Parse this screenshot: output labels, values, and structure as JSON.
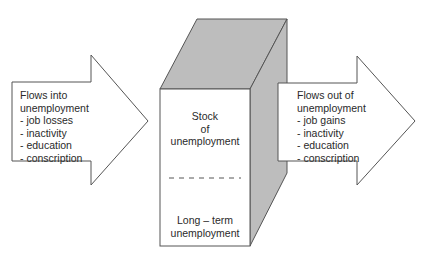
{
  "diagram": {
    "type": "stock-flow",
    "colors": {
      "outline": "#555555",
      "box_shade": "#bdbdbd",
      "background": "#ffffff",
      "text": "#2a2a2a"
    },
    "inflow": {
      "title_line1": "Flows into",
      "title_line2": "unemployment",
      "items": [
        "- job losses",
        "- inactivity",
        "- education",
        "- conscription"
      ]
    },
    "stock": {
      "top_line1": "Stock",
      "top_line2": "of",
      "top_line3": "unemployment",
      "bottom_line1": "Long – term",
      "bottom_line2": "unemployment"
    },
    "outflow": {
      "title_line1": "Flows out of",
      "title_line2": "unemployment",
      "items": [
        "- job gains",
        "- inactivity",
        "- education",
        "- conscription"
      ]
    }
  }
}
